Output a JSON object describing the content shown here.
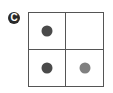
{
  "panel": {
    "label": "C"
  },
  "grid": {
    "rows": 2,
    "cols": 2,
    "border_color": "#555555",
    "cells": [
      {
        "position": "top-left",
        "has_dot": true,
        "dot_color": "#4a4a4a"
      },
      {
        "position": "top-right",
        "has_dot": false,
        "dot_color": null
      },
      {
        "position": "bottom-left",
        "has_dot": true,
        "dot_color": "#4a4a4a"
      },
      {
        "position": "bottom-right",
        "has_dot": true,
        "dot_color": "#808080"
      }
    ]
  }
}
